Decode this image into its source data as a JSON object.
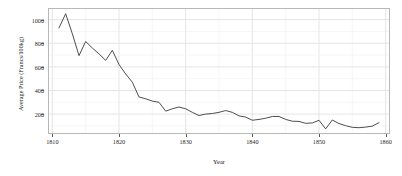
{
  "chart_data": {
    "type": "line",
    "title": "",
    "xlabel": "Year",
    "ylabel": "Average Price (Francs/100kg)",
    "xlim": [
      1809.5,
      1860.5
    ],
    "ylim": [
      40,
      1090
    ],
    "grid": true,
    "legend": null,
    "line_color": "#3a3a3a",
    "panel_border_color": "#b8b8b8",
    "grid_color": "#ebebeb",
    "xticks": [
      1810,
      1820,
      1830,
      1840,
      1850,
      1860
    ],
    "xtick_labels": [
      "1810",
      "1820",
      "1830",
      "1840",
      "1850",
      "1860"
    ],
    "yticks": [
      200,
      400,
      600,
      800,
      1000
    ],
    "ytick_labels": [
      "200",
      "400",
      "600",
      "800",
      "1000"
    ],
    "x": [
      1811,
      1812,
      1813,
      1814,
      1815,
      1816,
      1817,
      1818,
      1819,
      1820,
      1821,
      1822,
      1823,
      1824,
      1825,
      1826,
      1827,
      1828,
      1829,
      1830,
      1831,
      1832,
      1833,
      1834,
      1835,
      1836,
      1837,
      1838,
      1839,
      1840,
      1841,
      1842,
      1843,
      1844,
      1845,
      1846,
      1847,
      1848,
      1849,
      1850,
      1851,
      1852,
      1853,
      1854,
      1855,
      1856,
      1857,
      1858,
      1859
    ],
    "values": [
      930,
      1050,
      880,
      695,
      815,
      760,
      710,
      655,
      740,
      620,
      540,
      470,
      345,
      330,
      310,
      300,
      225,
      245,
      260,
      245,
      215,
      188,
      200,
      205,
      215,
      230,
      215,
      185,
      175,
      148,
      155,
      165,
      180,
      180,
      155,
      140,
      138,
      122,
      125,
      148,
      75,
      150,
      120,
      102,
      88,
      85,
      90,
      98,
      128
    ],
    "series": [
      {
        "name": "Average Price",
        "values": [
          930,
          1050,
          880,
          695,
          815,
          760,
          710,
          655,
          740,
          620,
          540,
          470,
          345,
          330,
          310,
          300,
          225,
          245,
          260,
          245,
          215,
          188,
          200,
          205,
          215,
          230,
          215,
          185,
          175,
          148,
          155,
          165,
          180,
          180,
          155,
          140,
          138,
          122,
          125,
          148,
          75,
          150,
          120,
          102,
          88,
          85,
          90,
          98,
          128
        ]
      }
    ]
  }
}
